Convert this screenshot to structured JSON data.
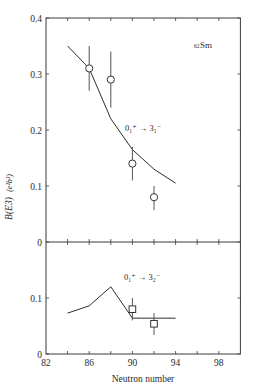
{
  "chart_data": [
    {
      "type": "line",
      "panel": "top",
      "title": "",
      "annotation": "0₁⁺ → 3₁⁻",
      "nucleus_label": {
        "prefix": "62",
        "symbol": "Sm"
      },
      "xlabel": "Neutron number",
      "ylabel": "B(E3) (e²b³)",
      "xlim": [
        82,
        100
      ],
      "ylim": [
        0,
        0.4
      ],
      "yticks": [
        0,
        0.1,
        0.2,
        0.3,
        0.4
      ],
      "ytick_labels": [
        "0",
        "0.1",
        "0.2",
        "0.3",
        "0.4"
      ],
      "grid": false,
      "series": [
        {
          "name": "theory",
          "style": "line",
          "x": [
            84,
            86,
            88,
            90,
            92,
            94
          ],
          "values": [
            0.35,
            0.31,
            0.22,
            0.165,
            0.13,
            0.105
          ]
        },
        {
          "name": "experiment",
          "style": "circle",
          "x": [
            86,
            88,
            90,
            92
          ],
          "values": [
            0.31,
            0.29,
            0.14,
            0.08
          ],
          "err_low": [
            0.27,
            0.24,
            0.11,
            0.057
          ],
          "err_high": [
            0.35,
            0.34,
            0.17,
            0.1
          ]
        }
      ]
    },
    {
      "type": "line",
      "panel": "bottom",
      "annotation": "0₁⁺ → 3₂⁻",
      "xlabel": "Neutron number",
      "xlim": [
        82,
        100
      ],
      "xticks": [
        82,
        86,
        90,
        94,
        98
      ],
      "xtick_labels": [
        "82",
        "86",
        "90",
        "94",
        "98"
      ],
      "ylim": [
        0,
        0.2
      ],
      "yticks": [
        0,
        0.1
      ],
      "ytick_labels": [
        "0",
        "0.1"
      ],
      "grid": false,
      "series": [
        {
          "name": "theory",
          "style": "line",
          "x": [
            84,
            86,
            88,
            90,
            94
          ],
          "values": [
            0.073,
            0.086,
            0.12,
            0.064,
            0.064
          ]
        },
        {
          "name": "experiment",
          "style": "square",
          "x": [
            90,
            92
          ],
          "values": [
            0.08,
            0.054
          ],
          "err_low": [
            0.06,
            0.034
          ],
          "err_high": [
            0.1,
            0.073
          ]
        }
      ]
    }
  ],
  "labels": {
    "ylabel_main": "B(E3)",
    "ylabel_units": "(e²b³)",
    "xlabel": "Neutron number",
    "nucleus_prefix": "62",
    "nucleus_symbol": "Sm",
    "top_transition": "0₁⁺ → 3₁⁻",
    "bottom_transition": "0₁⁺ → 3₂⁻"
  }
}
